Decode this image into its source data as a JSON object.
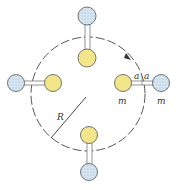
{
  "diagram": {
    "labels": {
      "radius": "R",
      "half_bond_left": "a",
      "half_bond_right": "a",
      "mass_inner": "m",
      "mass_outer": "m"
    },
    "colors": {
      "inner_atom": "#f3e58a",
      "outer_atom": "#cfe0ee",
      "stroke": "#555555",
      "circle": "#444444"
    },
    "circle": {
      "cx": 88,
      "cy": 94,
      "r": 57,
      "style": "dashed",
      "rotation": "counterclockwise-arrow"
    },
    "molecules": [
      {
        "position": "top",
        "inner": [
          87,
          58
        ],
        "outer": [
          87,
          16
        ]
      },
      {
        "position": "right",
        "inner": [
          123,
          83
        ],
        "outer": [
          161,
          83
        ]
      },
      {
        "position": "bottom",
        "inner": [
          89,
          135
        ],
        "outer": [
          89,
          172
        ]
      },
      {
        "position": "left",
        "inner": [
          53,
          83
        ],
        "outer": [
          16,
          83
        ]
      }
    ]
  }
}
